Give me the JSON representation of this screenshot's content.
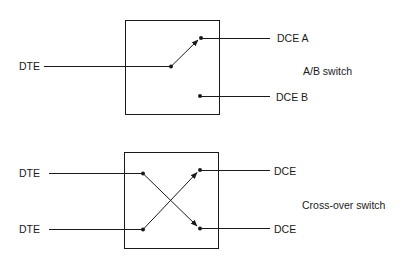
{
  "ab_switch": {
    "caption": "A/B switch",
    "input_label": "DTE",
    "output_a_label": "DCE A",
    "output_b_label": "DCE B",
    "connected_to": "DCE A"
  },
  "crossover_switch": {
    "caption": "Cross-over switch",
    "input_top_label": "DTE",
    "input_bottom_label": "DTE",
    "output_top_label": "DCE",
    "output_bottom_label": "DCE",
    "connections": [
      {
        "from": "input_top",
        "to": "output_bottom"
      },
      {
        "from": "input_bottom",
        "to": "output_top"
      }
    ]
  }
}
